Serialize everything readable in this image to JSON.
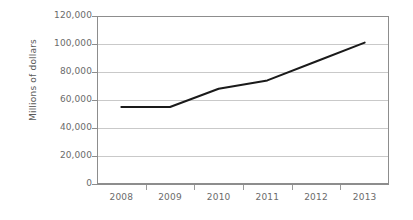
{
  "chart_data": {
    "type": "line",
    "title": "",
    "xlabel": "",
    "ylabel": "Millions of dollars",
    "categories": [
      "2008",
      "2009",
      "2010",
      "2011",
      "2012",
      "2013"
    ],
    "values": [
      55000,
      55000,
      68000,
      74000,
      87500,
      101000
    ],
    "series": [
      {
        "name": "",
        "values": [
          55000,
          55000,
          68000,
          74000,
          87500,
          101000
        ]
      }
    ],
    "ylim": [
      0,
      120000
    ],
    "ytick_labels": [
      "120,000",
      "100,000",
      "80,000",
      "60,000",
      "40,000",
      "20,000",
      "0"
    ],
    "ytick_values": [
      120000,
      100000,
      80000,
      60000,
      40000,
      20000,
      0
    ],
    "grid": true,
    "legend": "none",
    "line_color": "#1a1a1a",
    "grid_color": "#c9c9c9",
    "axis_color": "#8d8d8d",
    "text_color": "#6b6b6b",
    "background": "#ffffff"
  }
}
